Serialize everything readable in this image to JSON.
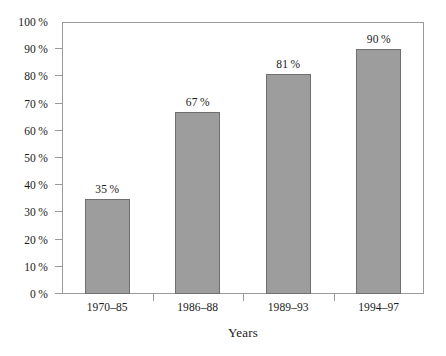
{
  "chart_data": {
    "type": "bar",
    "title": "",
    "subtitle": "",
    "xlabel": "Years",
    "ylabel": "",
    "categories": [
      "1970–85",
      "1986–88",
      "1989–93",
      "1994–97"
    ],
    "values": [
      35,
      67,
      81,
      90
    ],
    "value_labels": [
      "35 %",
      "67 %",
      "81 %",
      "90 %"
    ],
    "ylim": [
      0,
      100
    ],
    "ytick_values": [
      0,
      10,
      20,
      30,
      40,
      50,
      60,
      70,
      80,
      90,
      100
    ],
    "ytick_labels": [
      "0 %",
      "10 %",
      "20 %",
      "30 %",
      "40 %",
      "50 %",
      "60 %",
      "70 %",
      "80 %",
      "90 %",
      "100 %"
    ],
    "grid": false,
    "legend": null,
    "legend_position": "none",
    "series": [
      {
        "name": "",
        "values": [
          35,
          67,
          81,
          90
        ]
      }
    ],
    "colors": {
      "bar_fill": "#9d9d9d",
      "bar_edge": "#6f6f6f",
      "frame": "#9a9a9a",
      "text": "#1a1a1a",
      "background": "#ffffff"
    }
  }
}
